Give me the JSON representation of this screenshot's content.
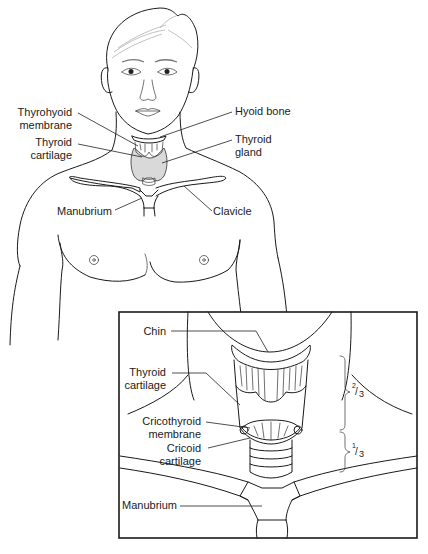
{
  "figure": {
    "colors": {
      "line": "#1a1a1a",
      "thyroid_fill": "#d9d9d9",
      "background": "#ffffff"
    },
    "main_labels": {
      "thyrohyoid_membrane": [
        "Thyrohyoid",
        "membrane"
      ],
      "thyroid_cartilage": [
        "Thyroid",
        "cartilage"
      ],
      "hyoid_bone": "Hyoid bone",
      "thyroid_gland": [
        "Thyroid",
        "gland"
      ],
      "manubrium": "Manubrium",
      "clavicle": "Clavicle"
    },
    "inset": {
      "labels": {
        "chin": "Chin",
        "thyroid_cartilage": [
          "Thyroid",
          "cartilage"
        ],
        "cricothyroid_membrane": [
          "Cricothyroid",
          "membrane"
        ],
        "cricoid_cartilage": [
          "Cricoid",
          "cartilage"
        ],
        "manubrium": "Manubrium"
      },
      "proportions": {
        "upper": {
          "numerator": "2",
          "denominator": "3"
        },
        "lower": {
          "numerator": "1",
          "denominator": "3"
        }
      }
    }
  }
}
